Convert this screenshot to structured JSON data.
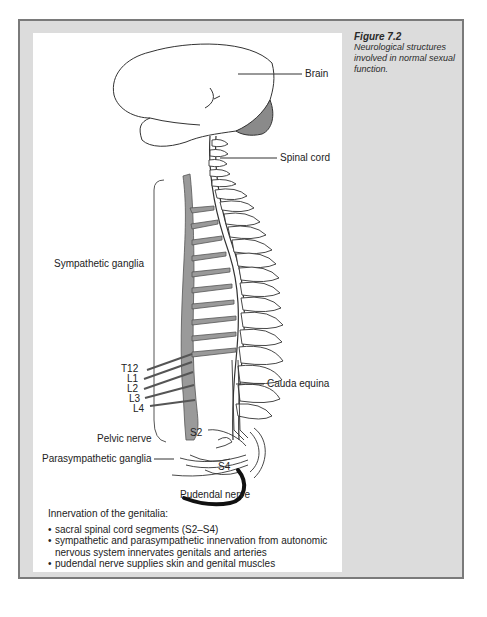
{
  "figure": {
    "number": "Figure 7.2",
    "caption": "Neurological structures involved in normal sexual function."
  },
  "labels": {
    "brain": "Brain",
    "spinal_cord": "Spinal cord",
    "sympathetic_ganglia": "Sympathetic ganglia",
    "t12": "T12",
    "l1": "L1",
    "l2": "L2",
    "l3": "L3",
    "l4": "L4",
    "cauda_equina": "Cauda equina",
    "s2": "S2",
    "pelvic_nerve": "Pelvic nerve",
    "parasympathetic_ganglia": "Parasympathetic ganglia",
    "s4": "S4",
    "pudendal_nerve": "Pudendal nerve"
  },
  "notes": {
    "heading": "Innervation of the genitalia:",
    "items": [
      "sacral spinal cord segments (S2–S4)",
      "sympathetic and parasympathetic innervation from autonomic nervous system innervates genitals and arteries",
      "pudendal nerve supplies skin and genital muscles"
    ]
  },
  "colors": {
    "frame_border": "#7a7a7a",
    "frame_fill": "#dcdcdc",
    "ganglia_fill": "#9a9a9a",
    "panel": "#ffffff"
  }
}
